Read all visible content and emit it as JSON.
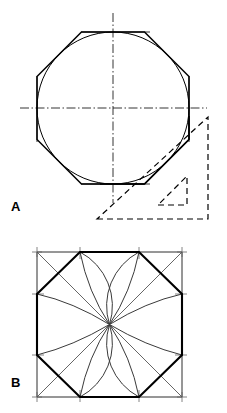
{
  "page": {
    "background_color": "#ffffff",
    "ink_color": "#000000",
    "width": 227,
    "height": 413
  },
  "figures": [
    {
      "key": "a",
      "label": "A",
      "caption": "Octagon circumscribed about a circle using a 45 degree set square",
      "elements": {
        "circle": {
          "cx": 113,
          "cy": 108,
          "r": 76
        },
        "octagon_name": "regular-octagon",
        "centerline_horizontal": {
          "x1": 22,
          "y1": 108,
          "x2": 205,
          "y2": 108
        },
        "centerline_vertical": {
          "x1": 113,
          "y1": 15,
          "x2": 113,
          "y2": 201
        },
        "set_square_name": "45-degree-set-square",
        "set_square_style": "dashed"
      }
    },
    {
      "key": "b",
      "label": "B",
      "caption": "Octagon inscribed in a square with construction arcs struck from the corners",
      "elements": {
        "square": {
          "x": 37,
          "y": 22,
          "size": 145
        },
        "octagon_name": "inscribed-octagon",
        "arc_count": 8,
        "diagonal_count": 4,
        "construction_color": "#9a9a9a"
      }
    }
  ],
  "labels": {
    "figure_a": "A",
    "figure_b": "B"
  }
}
